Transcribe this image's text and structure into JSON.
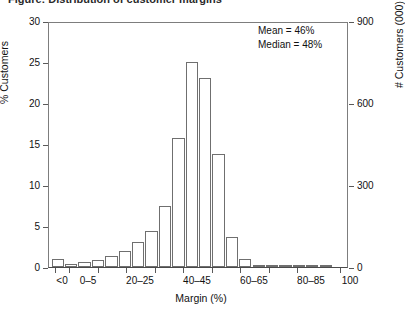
{
  "title": "Figure: Distribution of customer margins",
  "annotation": {
    "mean": "Mean = 46%",
    "median": "Median = 48%"
  },
  "axes": {
    "left_label": "% Customers",
    "right_label": "# Customers (000)",
    "x_label": "Margin (%)",
    "left_ticks": [
      "0",
      "5",
      "10",
      "15",
      "20",
      "25",
      "30"
    ],
    "right_ticks": [
      "0",
      "300",
      "600",
      "900"
    ],
    "x_ticks": [
      "<0",
      "0–5",
      "20–25",
      "40–45",
      "60–65",
      "80–85",
      "100"
    ]
  },
  "chart_data": {
    "type": "bar",
    "title": "Distribution of customer margins",
    "xlabel": "Margin (%)",
    "ylabel": "% Customers",
    "y2label": "# Customers (000)",
    "ylim": [
      0,
      30
    ],
    "y2lim": [
      0,
      900
    ],
    "grid": false,
    "legend": null,
    "annotations": [
      "Mean = 46%",
      "Median = 48%"
    ],
    "categories": [
      "<0",
      "0–5",
      "5–10",
      "10–15",
      "15–20",
      "20–25",
      "25–30",
      "30–35",
      "35–40",
      "40–45",
      "45–50",
      "50–55",
      "55–60",
      "60–65",
      "65–70",
      "70–75",
      "75–80",
      "80–85",
      "85–90",
      "90–95",
      "95–100"
    ],
    "values": [
      1.0,
      0.4,
      0.6,
      0.9,
      1.3,
      1.9,
      3.0,
      4.4,
      7.5,
      15.7,
      25.0,
      23.0,
      13.8,
      3.7,
      1.0,
      0.15,
      0.1,
      0.3,
      0.05,
      0.05,
      0.05
    ],
    "values_unit": "% Customers",
    "mean": 46,
    "median": 48
  }
}
